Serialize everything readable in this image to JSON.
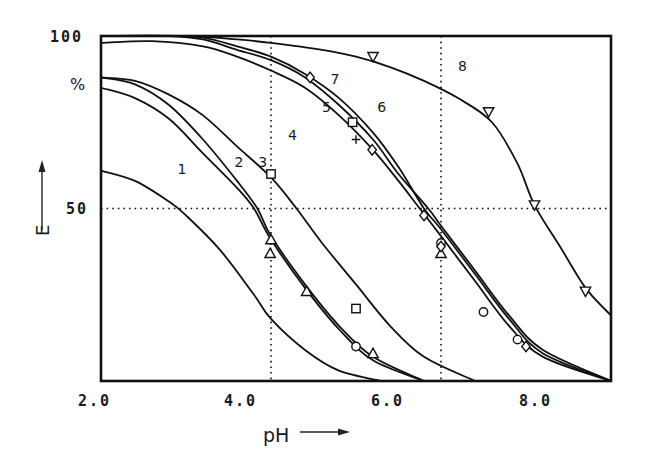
{
  "chart_data": {
    "type": "line",
    "title": "",
    "xlabel": "pH",
    "ylabel": "E",
    "y_unit_label": "%",
    "xlim": [
      2.0,
      8.0
    ],
    "ylim": [
      0,
      100
    ],
    "x_ticks": [
      "2.0",
      "4.0",
      "6.0",
      "8.0"
    ],
    "y_ticks": [
      "100",
      "50"
    ],
    "grid": {
      "x": [
        4.0,
        6.0
      ],
      "y": [
        50
      ],
      "style": "dotted"
    },
    "legend": "none (curves labeled inline 1-8)",
    "series": [
      {
        "name": "1",
        "label_pos": [
          2.9,
          60
        ],
        "points": [
          [
            2.0,
            61
          ],
          [
            2.4,
            58
          ],
          [
            2.8,
            52
          ],
          [
            3.0,
            48
          ],
          [
            3.4,
            38
          ],
          [
            3.8,
            25
          ],
          [
            4.0,
            18
          ],
          [
            4.4,
            9
          ],
          [
            4.8,
            3
          ],
          [
            5.3,
            0
          ]
        ]
      },
      {
        "name": "2",
        "label_pos": [
          3.57,
          62
        ],
        "points": [
          [
            2.0,
            85
          ],
          [
            2.4,
            82
          ],
          [
            2.8,
            76
          ],
          [
            3.2,
            66
          ],
          [
            3.6,
            56
          ],
          [
            3.8,
            50
          ],
          [
            4.0,
            41
          ],
          [
            4.4,
            27
          ],
          [
            4.8,
            15
          ],
          [
            5.2,
            6
          ],
          [
            5.8,
            0
          ]
        ]
      },
      {
        "name": "3",
        "label_pos": [
          3.85,
          62
        ],
        "points": [
          [
            2.0,
            88
          ],
          [
            2.4,
            86
          ],
          [
            2.8,
            80
          ],
          [
            3.2,
            70
          ],
          [
            3.6,
            58
          ],
          [
            3.84,
            50
          ],
          [
            4.0,
            42
          ],
          [
            4.4,
            28
          ],
          [
            4.8,
            16
          ],
          [
            5.2,
            7
          ],
          [
            5.8,
            0
          ]
        ]
      },
      {
        "name": "4",
        "label_pos": [
          4.2,
          70
        ],
        "points": [
          [
            2.0,
            88
          ],
          [
            2.4,
            87
          ],
          [
            2.8,
            83
          ],
          [
            3.2,
            77
          ],
          [
            3.6,
            68
          ],
          [
            4.0,
            59
          ],
          [
            4.3,
            50
          ],
          [
            4.6,
            40
          ],
          [
            5.0,
            28
          ],
          [
            5.4,
            16
          ],
          [
            5.8,
            7
          ],
          [
            6.4,
            0
          ]
        ]
      },
      {
        "name": "5",
        "label_pos": [
          4.6,
          78
        ],
        "points": [
          [
            2.0,
            98
          ],
          [
            2.6,
            98.5
          ],
          [
            3.2,
            97
          ],
          [
            3.6,
            94
          ],
          [
            4.0,
            90
          ],
          [
            4.4,
            85
          ],
          [
            4.8,
            77
          ],
          [
            5.2,
            67
          ],
          [
            5.5,
            58
          ],
          [
            5.75,
            50
          ],
          [
            6.0,
            42
          ],
          [
            6.4,
            29
          ],
          [
            6.8,
            16
          ],
          [
            7.2,
            7
          ],
          [
            8.0,
            0
          ]
        ]
      },
      {
        "name": "6",
        "label_pos": [
          5.25,
          78
        ],
        "points": [
          [
            2.0,
            100
          ],
          [
            2.8,
            100
          ],
          [
            3.2,
            99
          ],
          [
            3.6,
            96
          ],
          [
            4.0,
            93
          ],
          [
            4.4,
            88
          ],
          [
            4.8,
            80
          ],
          [
            5.2,
            70
          ],
          [
            5.5,
            60
          ],
          [
            5.85,
            50
          ],
          [
            6.0,
            45
          ],
          [
            6.4,
            32
          ],
          [
            6.8,
            19
          ],
          [
            7.2,
            9
          ],
          [
            8.0,
            0
          ]
        ]
      },
      {
        "name": "7",
        "label_pos": [
          4.7,
          86
        ],
        "points": [
          [
            2.0,
            100
          ],
          [
            2.8,
            100
          ],
          [
            3.2,
            99.5
          ],
          [
            3.6,
            97
          ],
          [
            4.0,
            94
          ],
          [
            4.4,
            89
          ],
          [
            4.8,
            82
          ],
          [
            5.2,
            72
          ],
          [
            5.5,
            62
          ],
          [
            5.8,
            50
          ],
          [
            6.0,
            44
          ],
          [
            6.4,
            31
          ],
          [
            6.8,
            18
          ],
          [
            7.2,
            8
          ],
          [
            8.0,
            0
          ]
        ]
      },
      {
        "name": "8",
        "label_pos": [
          6.2,
          90
        ],
        "points": [
          [
            2.0,
            100
          ],
          [
            3.0,
            100
          ],
          [
            3.6,
            99
          ],
          [
            4.0,
            98
          ],
          [
            4.6,
            96
          ],
          [
            5.0,
            94
          ],
          [
            5.4,
            91
          ],
          [
            5.8,
            87
          ],
          [
            6.2,
            82
          ],
          [
            6.6,
            75
          ],
          [
            6.9,
            63
          ],
          [
            7.1,
            51
          ],
          [
            7.4,
            39
          ],
          [
            7.7,
            27
          ],
          [
            8.0,
            19
          ]
        ]
      }
    ],
    "markers": [
      {
        "shape": "square",
        "x": 4.0,
        "y": 60
      },
      {
        "shape": "square",
        "x": 5.0,
        "y": 21
      },
      {
        "shape": "square",
        "x": 4.96,
        "y": 75
      },
      {
        "shape": "triangle-up",
        "x": 4.0,
        "y": 41
      },
      {
        "shape": "triangle-up",
        "x": 3.99,
        "y": 37
      },
      {
        "shape": "triangle-up",
        "x": 4.42,
        "y": 26
      },
      {
        "shape": "triangle-up",
        "x": 5.2,
        "y": 8
      },
      {
        "shape": "circle",
        "x": 5.0,
        "y": 10
      },
      {
        "shape": "diamond",
        "x": 4.46,
        "y": 88
      },
      {
        "shape": "diamond",
        "x": 5.19,
        "y": 67
      },
      {
        "shape": "cross",
        "x": 5.0,
        "y": 70
      },
      {
        "shape": "diamond",
        "x": 5.8,
        "y": 48
      },
      {
        "shape": "circle",
        "x": 6.0,
        "y": 40
      },
      {
        "shape": "triangle-up",
        "x": 6.0,
        "y": 37
      },
      {
        "shape": "diamond",
        "x": 6.0,
        "y": 39
      },
      {
        "shape": "circle",
        "x": 6.5,
        "y": 20
      },
      {
        "shape": "circle",
        "x": 6.9,
        "y": 12
      },
      {
        "shape": "diamond",
        "x": 7.0,
        "y": 10
      },
      {
        "shape": "triangle-down",
        "x": 5.2,
        "y": 94
      },
      {
        "shape": "triangle-down",
        "x": 6.56,
        "y": 78
      },
      {
        "shape": "triangle-down",
        "x": 7.1,
        "y": 51
      },
      {
        "shape": "triangle-down",
        "x": 7.7,
        "y": 26
      }
    ]
  },
  "labels": {
    "y_axis": "E",
    "y_unit": "%",
    "x_axis": "pH",
    "y100": "100",
    "y50": "50",
    "x2": "2.0",
    "x4": "4.0",
    "x6": "6.0",
    "x8": "8.0"
  }
}
